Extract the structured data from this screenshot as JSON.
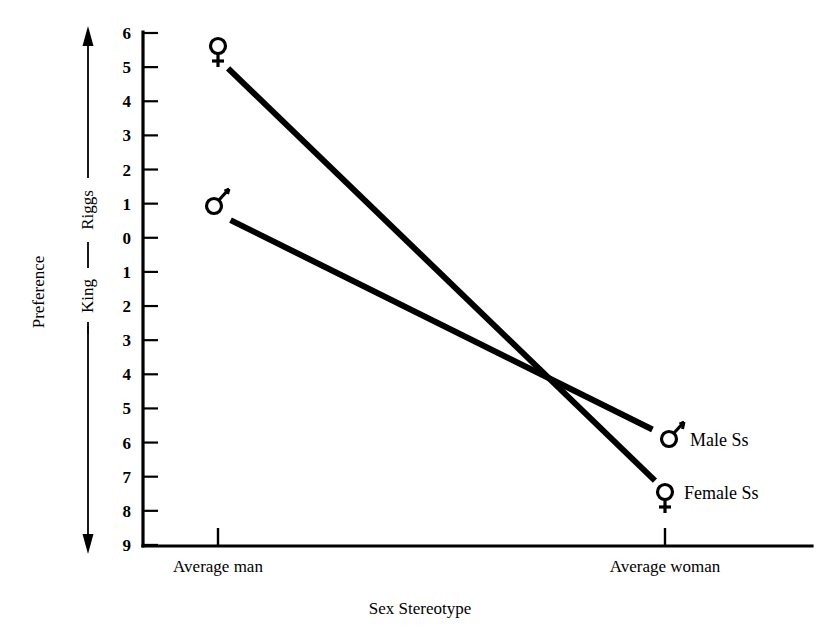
{
  "chart_data": {
    "type": "line",
    "title": "",
    "xlabel": "Sex Stereotype",
    "ylabel": "Preference",
    "categories": [
      "Average man",
      "Average woman"
    ],
    "axis_poles": {
      "top": "Riggs",
      "bottom": "King"
    },
    "ytick_labels": [
      "6",
      "5",
      "4",
      "3",
      "2",
      "1",
      "0",
      "1",
      "2",
      "3",
      "4",
      "5",
      "6",
      "7",
      "8",
      "9"
    ],
    "ytick_values": [
      -6,
      -5,
      -4,
      -3,
      -2,
      -1,
      0,
      1,
      2,
      3,
      4,
      5,
      6,
      7,
      8,
      9
    ],
    "ylim": [
      -6,
      9
    ],
    "ylim_note": "Negative = King preference side (upper), positive = Riggs preference side (lower)",
    "grid": false,
    "legend_position": "inline-right-endpoints",
    "series": [
      {
        "name": "Male Ss",
        "symbol": "male-symbol",
        "symbol_glyph": "♂",
        "label": "Male Ss",
        "values": [
          -0.7,
          5.8
        ],
        "points": [
          {
            "category": "Average man",
            "value": -0.7,
            "scale_side": "King",
            "reading": "King 0.7"
          },
          {
            "category": "Average woman",
            "value": 5.8,
            "scale_side": "Riggs",
            "reading": "Riggs 5.8"
          }
        ]
      },
      {
        "name": "Female Ss",
        "symbol": "female-symbol",
        "symbol_glyph": "♀",
        "label": "Female Ss",
        "values": [
          -5.25,
          7.4
        ],
        "points": [
          {
            "category": "Average man",
            "value": -5.25,
            "scale_side": "King",
            "reading": "King 5.25"
          },
          {
            "category": "Average woman",
            "value": 7.4,
            "scale_side": "Riggs",
            "reading": "Riggs 7.4"
          }
        ]
      }
    ],
    "annotations": [
      {
        "name": "crossing-point",
        "note": "Male and Female lines intersect near x between categories at value ~4.6"
      }
    ],
    "colors": {
      "line": "#000000",
      "axis": "#000000",
      "background": "#ffffff"
    }
  }
}
